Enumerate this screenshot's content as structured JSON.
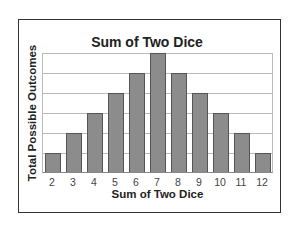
{
  "chart_data": {
    "type": "bar",
    "title": "Sum of Two Dice",
    "xlabel": "Sum of Two Dice",
    "ylabel": "Total Possible Outcomes",
    "categories": [
      "2",
      "3",
      "4",
      "5",
      "6",
      "7",
      "8",
      "9",
      "10",
      "11",
      "12"
    ],
    "values": [
      1,
      2,
      3,
      4,
      5,
      6,
      5,
      4,
      3,
      2,
      1
    ],
    "ylim": [
      0,
      6
    ],
    "grid": true,
    "y_tick_labels_shown": false,
    "bar_color": "#8c8c8c"
  }
}
